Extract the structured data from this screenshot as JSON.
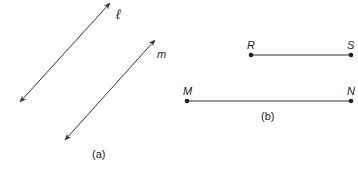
{
  "figure_a": {
    "caption": "(a)",
    "lines": [
      {
        "name": "ℓ",
        "from": [
          20,
          102
        ],
        "to": [
          110,
          3
        ],
        "label_pos": [
          118,
          17
        ]
      },
      {
        "name": "m",
        "from": [
          65,
          140
        ],
        "to": [
          155,
          40
        ],
        "label_pos": [
          158,
          56
        ]
      }
    ]
  },
  "figure_b": {
    "caption": "(b)",
    "segments": [
      {
        "endpoints": [
          "R",
          "S"
        ],
        "from": [
          251,
          55
        ],
        "to": [
          351,
          55
        ]
      },
      {
        "endpoints": [
          "M",
          "N"
        ],
        "from": [
          187,
          101
        ],
        "to": [
          351,
          101
        ]
      }
    ]
  },
  "colors": {
    "stroke": "#333333",
    "text": "#222222"
  }
}
